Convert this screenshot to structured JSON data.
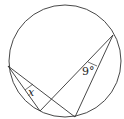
{
  "diagram": {
    "type": "circle-geometry",
    "labels": {
      "x_angle": "x",
      "given_angle": "9°"
    },
    "colors": {
      "stroke": "#333333",
      "background": "#ffffff"
    }
  }
}
